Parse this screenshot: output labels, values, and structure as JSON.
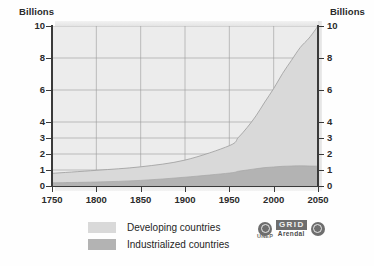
{
  "axis_captions": {
    "left": "Billions",
    "right": "Billions"
  },
  "legend": {
    "items": [
      {
        "label": "Developing countries",
        "color": "#d9d9d9",
        "swatch_name": "legend-swatch-developing"
      },
      {
        "label": "Industrialized countries",
        "color": "#b3b3b3",
        "swatch_name": "legend-swatch-industrialized"
      }
    ]
  },
  "logos": {
    "unep_left_name": "unep-logo-icon",
    "grid_letters": "GRID",
    "grid_sub": "Arendal",
    "unep_sub": "UNEP",
    "un_right_name": "un-logo-icon"
  },
  "chart_data": {
    "type": "area",
    "title": "",
    "subtitle": "",
    "xlabel": "",
    "ylabel": "Billions",
    "stacked": true,
    "grid": true,
    "legend_position": "bottom-left",
    "xlim": [
      1750,
      2050
    ],
    "ylim": [
      0,
      10
    ],
    "xticks": [
      1750,
      1800,
      1850,
      1900,
      1950,
      2000,
      2050
    ],
    "xtick_labels": [
      "1750",
      "1800",
      "1850",
      "1900",
      "1950",
      "2000",
      "2050"
    ],
    "yticks": [
      0,
      1,
      2,
      3,
      4,
      6,
      8,
      10
    ],
    "ytick_labels": [
      "0",
      "1",
      "2",
      "3",
      "4",
      "6",
      "8",
      "10"
    ],
    "x": [
      1750,
      1800,
      1850,
      1900,
      1950,
      1960,
      1970,
      1980,
      1990,
      2000,
      2010,
      2020,
      2030,
      2040,
      2050
    ],
    "series": [
      {
        "name": "Industrialized countries",
        "color": "#b3b3b3",
        "values": [
          0.2,
          0.25,
          0.35,
          0.55,
          0.81,
          0.92,
          1.0,
          1.08,
          1.15,
          1.19,
          1.23,
          1.25,
          1.26,
          1.25,
          1.24
        ]
      },
      {
        "name": "Developing countries",
        "color": "#d9d9d9",
        "values": [
          0.59,
          0.73,
          0.85,
          1.07,
          1.71,
          2.1,
          2.65,
          3.3,
          4.1,
          4.9,
          5.8,
          6.6,
          7.4,
          8.0,
          8.76
        ]
      }
    ],
    "total": [
      0.79,
      0.98,
      1.2,
      1.62,
      2.52,
      3.02,
      3.65,
      4.38,
      5.25,
      6.09,
      7.03,
      7.85,
      8.66,
      9.25,
      10.0
    ]
  }
}
